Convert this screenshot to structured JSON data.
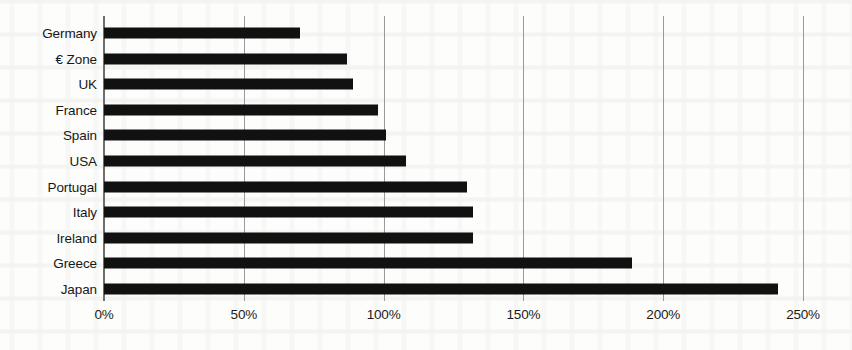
{
  "chart_data": {
    "type": "bar",
    "orientation": "horizontal",
    "title": "",
    "subtitle": "",
    "xlabel": "",
    "ylabel": "",
    "categories": [
      "Germany",
      "€ Zone",
      "UK",
      "France",
      "Spain",
      "USA",
      "Portugal",
      "Italy",
      "Ireland",
      "Greece",
      "Japan"
    ],
    "values": [
      70,
      87,
      89,
      98,
      101,
      108,
      130,
      132,
      132,
      189,
      241
    ],
    "value_suffix": "%",
    "xlim": [
      0,
      250
    ],
    "xticks": [
      0,
      50,
      100,
      150,
      200,
      250
    ],
    "xticklabels": [
      "0%",
      "50%",
      "100%",
      "150%",
      "200%",
      "250%"
    ],
    "grid": "vertical",
    "legend": "none",
    "bar_color": "#111111",
    "gridline_color": "#9a9a9a",
    "background_color": "#fdfdfb"
  }
}
